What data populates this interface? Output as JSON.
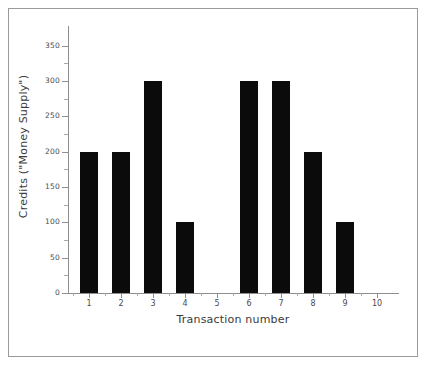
{
  "figure": {
    "background_color": "#ffffff",
    "frame_color": "#9a9a9a",
    "bar_color": "#0b0b0b",
    "axis_color": "#8e8e8e"
  },
  "chart_data": {
    "type": "bar",
    "title": "",
    "subtitle": "",
    "xlabel": "Transaction number",
    "ylabel": "Credits (\"Money Supply\")",
    "categories": [
      "1",
      "2",
      "3",
      "4",
      "5",
      "6",
      "7",
      "8",
      "9",
      "10"
    ],
    "values": [
      200,
      200,
      300,
      100,
      0,
      300,
      300,
      200,
      100,
      0
    ],
    "series": [
      {
        "name": "Credits",
        "values": [
          200,
          200,
          300,
          100,
          0,
          300,
          300,
          200,
          100,
          0
        ]
      }
    ],
    "xlim": [
      0.35,
      10.65
    ],
    "ylim": [
      0,
      375
    ],
    "ytick_labels": [
      "0",
      "50",
      "100",
      "150",
      "200",
      "250",
      "300",
      "350"
    ],
    "ytick_values": [
      0,
      50,
      100,
      150,
      200,
      250,
      300,
      350
    ],
    "y_minor_tick_values": [
      25,
      75,
      125,
      175,
      225,
      275,
      325
    ],
    "xtick_labels": [
      "1",
      "2",
      "3",
      "4",
      "5",
      "6",
      "7",
      "8",
      "9",
      "10"
    ],
    "xtick_values": [
      1,
      2,
      3,
      4,
      5,
      6,
      7,
      8,
      9,
      10
    ],
    "grid": false,
    "legend": null,
    "legend_position": "none",
    "annotations": []
  }
}
